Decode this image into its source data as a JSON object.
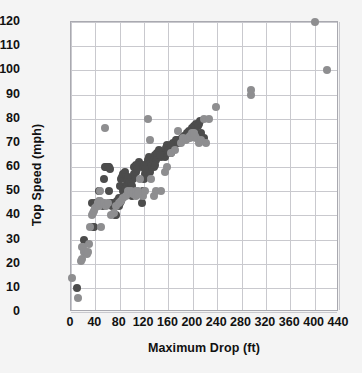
{
  "chart_data": {
    "type": "scatter",
    "title": "",
    "xlabel": "Maximum Drop (ft)",
    "ylabel": "Top Speed (mph)",
    "xlim": [
      0,
      440
    ],
    "ylim": [
      0,
      120
    ],
    "xticks": [
      0,
      40,
      80,
      120,
      160,
      200,
      240,
      280,
      320,
      360,
      400,
      440
    ],
    "yticks": [
      0,
      10,
      20,
      30,
      40,
      50,
      60,
      70,
      80,
      90,
      100,
      110,
      120
    ],
    "xtick_labels": [
      "0",
      "40",
      "80",
      "120",
      "160",
      "200",
      "240",
      "280",
      "320",
      "360",
      "400",
      "440"
    ],
    "ytick_labels": [
      "0",
      "10",
      "20",
      "30",
      "40",
      "50",
      "60",
      "70",
      "80",
      "90",
      "100",
      "110",
      "120"
    ],
    "grid": true,
    "legend": "none",
    "colors": {
      "series_dark": "#4c4c4c",
      "series_light": "#8e8e90",
      "gridline": "#c9c9ce",
      "axis": "#a9a9b0",
      "plot_background": "#ffffff",
      "page_background": "#f4f4f4",
      "text": "#111111"
    },
    "series": [
      {
        "name": "steel",
        "color": "#4c4c4c",
        "points": [
          [
            10,
            10
          ],
          [
            22,
            30
          ],
          [
            34,
            45
          ],
          [
            36,
            35
          ],
          [
            38,
            35
          ],
          [
            40,
            45
          ],
          [
            42,
            45
          ],
          [
            44,
            45
          ],
          [
            46,
            50
          ],
          [
            50,
            45
          ],
          [
            52,
            44
          ],
          [
            54,
            55
          ],
          [
            56,
            60
          ],
          [
            58,
            60
          ],
          [
            60,
            60
          ],
          [
            62,
            50
          ],
          [
            64,
            45
          ],
          [
            66,
            45
          ],
          [
            68,
            44
          ],
          [
            70,
            45
          ],
          [
            72,
            40
          ],
          [
            74,
            40
          ],
          [
            76,
            46
          ],
          [
            78,
            47
          ],
          [
            80,
            52
          ],
          [
            82,
            55
          ],
          [
            84,
            56
          ],
          [
            86,
            57
          ],
          [
            88,
            58
          ],
          [
            90,
            52
          ],
          [
            92,
            53
          ],
          [
            94,
            54
          ],
          [
            96,
            55
          ],
          [
            98,
            50
          ],
          [
            100,
            48
          ],
          [
            102,
            55
          ],
          [
            104,
            57
          ],
          [
            106,
            58
          ],
          [
            108,
            60
          ],
          [
            110,
            60
          ],
          [
            112,
            62
          ],
          [
            114,
            61
          ],
          [
            116,
            45
          ],
          [
            118,
            50
          ],
          [
            120,
            55
          ],
          [
            122,
            57
          ],
          [
            124,
            60
          ],
          [
            126,
            63
          ],
          [
            128,
            64
          ],
          [
            130,
            58
          ],
          [
            132,
            60
          ],
          [
            134,
            62
          ],
          [
            136,
            64
          ],
          [
            138,
            65
          ],
          [
            140,
            63
          ],
          [
            142,
            64
          ],
          [
            144,
            65
          ],
          [
            146,
            66
          ],
          [
            148,
            64
          ],
          [
            150,
            66
          ],
          [
            152,
            65
          ],
          [
            154,
            64
          ],
          [
            156,
            66
          ],
          [
            158,
            67
          ],
          [
            160,
            66
          ],
          [
            162,
            68
          ],
          [
            164,
            66
          ],
          [
            166,
            67
          ],
          [
            170,
            70
          ],
          [
            174,
            71
          ],
          [
            178,
            70
          ],
          [
            182,
            72
          ],
          [
            186,
            73
          ],
          [
            190,
            74
          ],
          [
            194,
            75
          ],
          [
            198,
            76
          ],
          [
            202,
            77
          ],
          [
            206,
            78
          ],
          [
            210,
            78
          ],
          [
            214,
            74
          ],
          [
            218,
            72
          ],
          [
            60,
            60
          ],
          [
            62,
            60
          ],
          [
            64,
            59
          ],
          [
            90,
            56
          ],
          [
            92,
            55
          ],
          [
            94,
            56
          ],
          [
            96,
            54
          ],
          [
            98,
            53
          ],
          [
            100,
            52
          ],
          [
            86,
            50
          ],
          [
            88,
            51
          ],
          [
            78,
            44
          ],
          [
            80,
            45
          ],
          [
            82,
            46
          ],
          [
            84,
            47
          ],
          [
            104,
            60
          ],
          [
            106,
            61
          ],
          [
            108,
            59
          ],
          [
            118,
            60
          ],
          [
            120,
            61
          ],
          [
            122,
            59
          ],
          [
            136,
            60
          ],
          [
            138,
            61
          ],
          [
            142,
            66
          ],
          [
            144,
            67
          ],
          [
            146,
            65
          ],
          [
            156,
            68
          ],
          [
            158,
            69
          ],
          [
            160,
            67
          ],
          [
            164,
            69
          ],
          [
            168,
            70
          ],
          [
            172,
            71
          ],
          [
            176,
            70
          ],
          [
            180,
            71
          ],
          [
            184,
            72
          ],
          [
            188,
            73
          ],
          [
            192,
            74
          ],
          [
            196,
            74
          ],
          [
            200,
            75
          ],
          [
            204,
            76
          ],
          [
            208,
            77
          ],
          [
            212,
            79
          ]
        ]
      },
      {
        "name": "wood",
        "color": "#8e8e90",
        "points": [
          [
            2,
            14
          ],
          [
            12,
            6
          ],
          [
            16,
            21
          ],
          [
            18,
            22
          ],
          [
            18,
            27
          ],
          [
            20,
            27
          ],
          [
            22,
            25
          ],
          [
            24,
            25
          ],
          [
            26,
            24
          ],
          [
            28,
            25
          ],
          [
            30,
            28
          ],
          [
            32,
            35
          ],
          [
            34,
            40
          ],
          [
            36,
            41
          ],
          [
            38,
            42
          ],
          [
            40,
            43
          ],
          [
            42,
            44
          ],
          [
            44,
            45
          ],
          [
            46,
            46
          ],
          [
            48,
            50
          ],
          [
            50,
            35
          ],
          [
            52,
            45
          ],
          [
            56,
            76
          ],
          [
            66,
            40
          ],
          [
            70,
            41
          ],
          [
            74,
            44
          ],
          [
            78,
            45
          ],
          [
            82,
            46
          ],
          [
            86,
            47
          ],
          [
            90,
            48
          ],
          [
            94,
            50
          ],
          [
            98,
            50
          ],
          [
            102,
            49
          ],
          [
            106,
            50
          ],
          [
            110,
            50
          ],
          [
            114,
            55
          ],
          [
            118,
            48
          ],
          [
            122,
            50
          ],
          [
            126,
            80
          ],
          [
            130,
            71
          ],
          [
            132,
            55
          ],
          [
            136,
            48
          ],
          [
            140,
            50
          ],
          [
            148,
            50
          ],
          [
            154,
            58
          ],
          [
            158,
            60
          ],
          [
            164,
            66
          ],
          [
            170,
            67
          ],
          [
            176,
            75
          ],
          [
            180,
            70
          ],
          [
            184,
            72
          ],
          [
            188,
            71
          ],
          [
            192,
            72
          ],
          [
            196,
            72
          ],
          [
            200,
            73
          ],
          [
            204,
            73
          ],
          [
            206,
            72
          ],
          [
            210,
            70
          ],
          [
            214,
            71
          ],
          [
            218,
            80
          ],
          [
            222,
            70
          ],
          [
            226,
            80
          ],
          [
            238,
            85
          ],
          [
            296,
            90
          ],
          [
            296,
            92
          ],
          [
            400,
            120
          ],
          [
            420,
            100
          ],
          [
            44,
            45
          ],
          [
            46,
            44
          ],
          [
            48,
            46
          ],
          [
            54,
            45
          ],
          [
            58,
            44
          ],
          [
            60,
            45
          ],
          [
            106,
            48
          ],
          [
            110,
            49
          ],
          [
            196,
            73
          ],
          [
            198,
            74
          ],
          [
            202,
            74
          ]
        ]
      }
    ]
  }
}
